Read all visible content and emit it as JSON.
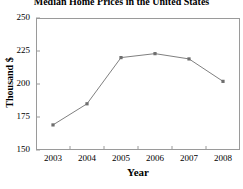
{
  "chart_data": {
    "type": "line",
    "title": "Median Home Prices in the United States",
    "xlabel": "Year",
    "ylabel": "Thousand $",
    "categories": [
      "2003",
      "2004",
      "2005",
      "2006",
      "2007",
      "2008"
    ],
    "values": [
      169,
      185,
      220,
      223,
      219,
      202
    ],
    "series": [
      {
        "name": "Median Home Price",
        "values": [
          169,
          185,
          220,
          223,
          219,
          202
        ]
      }
    ],
    "ylim": [
      150,
      250
    ],
    "yticks": [
      150,
      175,
      200,
      225,
      250
    ],
    "ytick_labels": [
      "150",
      "175",
      "200",
      "225",
      "250"
    ],
    "xtick_labels": [
      "2003",
      "2004",
      "2005",
      "2006",
      "2007",
      "2008"
    ],
    "grid": false,
    "legend": "none",
    "line_color": "#808080",
    "marker": "square",
    "marker_color": "#6e6e6e",
    "axis_color": "#9a9a9a",
    "background": "#ffffff"
  }
}
